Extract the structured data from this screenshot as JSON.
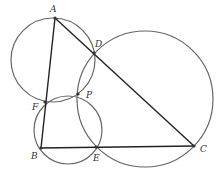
{
  "diagram": {
    "points": [
      {
        "name": "A",
        "x": 55,
        "y": 18,
        "lx": 50,
        "ly": 12
      },
      {
        "name": "D",
        "x": 94,
        "y": 53,
        "lx": 95,
        "ly": 47
      },
      {
        "name": "F",
        "x": 45,
        "y": 102,
        "lx": 32,
        "ly": 110
      },
      {
        "name": "P",
        "x": 78,
        "y": 94,
        "lx": 86,
        "ly": 98
      },
      {
        "name": "B",
        "x": 41,
        "y": 148,
        "lx": 31,
        "ly": 159
      },
      {
        "name": "E",
        "x": 96,
        "y": 147,
        "lx": 93,
        "ly": 161
      },
      {
        "name": "C",
        "x": 194,
        "y": 146,
        "lx": 200,
        "ly": 152
      }
    ],
    "segments": [
      [
        "A",
        "B"
      ],
      [
        "A",
        "C"
      ],
      [
        "B",
        "C"
      ]
    ],
    "circles": [
      {
        "through": [
          "A",
          "D",
          "P",
          "F"
        ],
        "cx": 53,
        "cy": 60,
        "r": 42
      },
      {
        "through": [
          "B",
          "F",
          "P",
          "E"
        ],
        "cx": 68,
        "cy": 130,
        "r": 34
      },
      {
        "through": [
          "D",
          "P",
          "E",
          "C"
        ],
        "cx": 145,
        "cy": 99,
        "r": 68
      }
    ]
  }
}
